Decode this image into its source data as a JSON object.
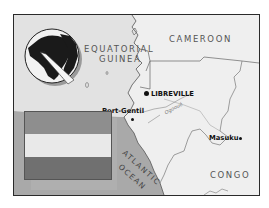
{
  "map": {
    "countries": {
      "equatorial_guinea_line1": "EQUATORIAL",
      "equatorial_guinea_line2": "GUINEA",
      "cameroon": "CAMEROON",
      "congo": "CONGO"
    },
    "cities": {
      "capital": "LIBREVILLE",
      "port_gentil": "Port-Gentil",
      "masuku": "Masuku"
    },
    "river": "Ogooué",
    "ocean": {
      "line1": "ATLANTIC",
      "line2": "OCEAN"
    },
    "locator_globe": "globe-locator-icon",
    "flag": {
      "colors": [
        "#8e8e8e",
        "#e9e9e9",
        "#6f6f6f"
      ],
      "stripes": [
        "green",
        "yellow",
        "blue"
      ]
    },
    "colors": {
      "land": "#ececec",
      "ocean": "#a9a9a9",
      "border": "#2a2a2a",
      "outside_land": "#f6f6f6"
    }
  }
}
